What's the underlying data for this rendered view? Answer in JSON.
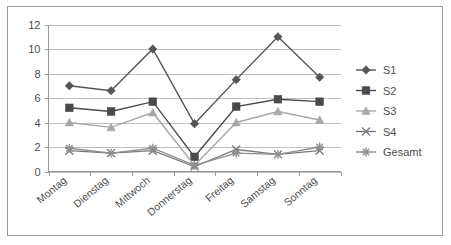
{
  "chart_data": {
    "type": "line",
    "title": "",
    "subtitle": "",
    "xlabel": "",
    "ylabel": "",
    "categories": [
      "Montag",
      "Dienstag",
      "Mittwoch",
      "Donnerstag",
      "Freitag",
      "Samstag",
      "Sonntag"
    ],
    "ylim": [
      0,
      12
    ],
    "yticks": [
      0,
      2,
      4,
      6,
      8,
      10,
      12
    ],
    "ytick_labels": [
      "0",
      "2",
      "4",
      "6",
      "8",
      "10",
      "12"
    ],
    "grid": "horizontal",
    "legend_position": "right",
    "series": [
      {
        "name": "S1",
        "marker": "diamond",
        "color": "#555555",
        "values": [
          7.0,
          6.6,
          10.0,
          3.9,
          7.5,
          11.0,
          7.7
        ]
      },
      {
        "name": "S2",
        "marker": "square",
        "color": "#4a4a4a",
        "values": [
          5.2,
          4.9,
          5.7,
          1.2,
          5.3,
          5.9,
          5.7
        ]
      },
      {
        "name": "S3",
        "marker": "triangle",
        "color": "#a8a8a8",
        "values": [
          4.0,
          3.6,
          4.8,
          0.5,
          4.0,
          4.9,
          4.2
        ]
      },
      {
        "name": "S4",
        "marker": "cross",
        "color": "#7a7a7a",
        "values": [
          1.7,
          1.5,
          1.7,
          0.4,
          1.8,
          1.4,
          1.7
        ]
      },
      {
        "name": "Gesamt",
        "marker": "asterisk",
        "color": "#8f8f8f",
        "values": [
          1.9,
          1.5,
          1.9,
          0.5,
          1.5,
          1.4,
          2.0
        ]
      }
    ],
    "colors": {
      "gridline": "#bfbfbf",
      "axis": "#9a9a9a",
      "text": "#4d4d4d",
      "frame": "#9a9a9a",
      "background": "#ffffff"
    }
  },
  "legend": {
    "items": [
      {
        "label": "S1"
      },
      {
        "label": "S2"
      },
      {
        "label": "S3"
      },
      {
        "label": "S4"
      },
      {
        "label": "Gesamt"
      }
    ]
  }
}
